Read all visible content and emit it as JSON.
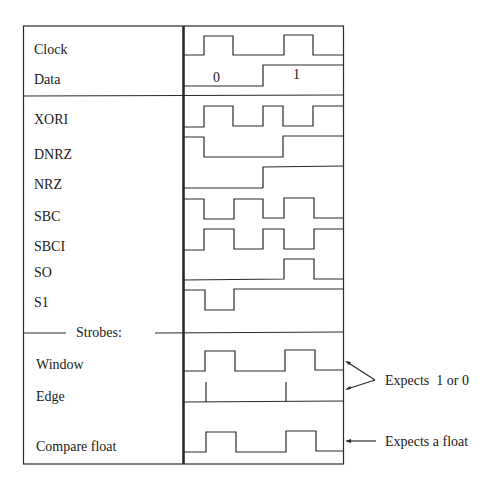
{
  "diagram": {
    "signals": [
      {
        "id": "clock",
        "label": "Clock",
        "label_y": 42
      },
      {
        "id": "data",
        "label": "Data",
        "label_y": 72
      },
      {
        "id": "xori",
        "label": "XORI",
        "label_y": 112
      },
      {
        "id": "dnrz",
        "label": "DNRZ",
        "label_y": 147
      },
      {
        "id": "nrz",
        "label": "NRZ",
        "label_y": 177
      },
      {
        "id": "sbc",
        "label": "SBC",
        "label_y": 209
      },
      {
        "id": "sbci",
        "label": "SBCI",
        "label_y": 239
      },
      {
        "id": "so",
        "label": "SO",
        "label_y": 265
      },
      {
        "id": "s1",
        "label": "S1",
        "label_y": 295
      },
      {
        "id": "window",
        "label": "Window",
        "label_y": 357
      },
      {
        "id": "edge",
        "label": "Edge",
        "label_y": 389
      },
      {
        "id": "compare_float",
        "label": "Compare float",
        "label_y": 439
      }
    ],
    "section_header": "Strobes:",
    "data_values": [
      "0",
      "1"
    ],
    "annotations": {
      "binary": "Expects  1 or 0",
      "float": "Expects a float"
    },
    "colors": {
      "line": "#2a2a2a",
      "background": "#ffffff"
    },
    "waveforms": {
      "clock": "183,55 204,55 204,36 233,36 233,55 284,55 284,35 313,35 313,55 343,55",
      "data": "183,86 263,86 263,65 343,65",
      "xori": "183,127 204,127 204,106 233,106 233,126 263,126 263,106 283,106 283,126 313,126 313,106 343,106",
      "dnrz": "183,137 204,137 204,157 283,157 283,136 343,136",
      "nrz": "263,188 263,167 343,166",
      "sbc": "183,199 204,199 204,219 234,219 234,199 263,199 263,218 284,218 284,198 314,198 314,218 343,218",
      "sbci": "183,250 204,250 204,229 234,229 234,249 263,249 263,229 284,229 284,249 314,249 314,229 343,229",
      "so": "183,280 284,279 284,259 314,259 314,279 343,279",
      "s1": "183,290 205,290 205,310 234,310 234,289 343,289",
      "window": "183,371 205,371 205,351 235,351 235,371 285,371 285,350 315,350 315,370 343,370",
      "compare_float": "183,452 206,452 206,432 236,432 236,452 286,452 286,431 316,431 316,451 343,451"
    }
  }
}
